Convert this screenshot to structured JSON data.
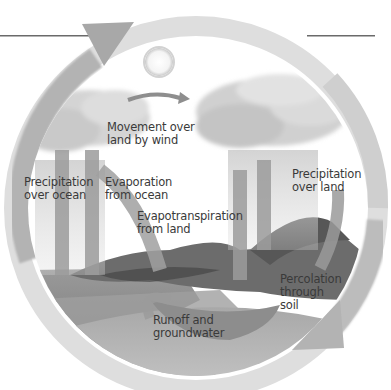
{
  "diagram": {
    "title": "",
    "theme": "water-cycle",
    "colors": {
      "outer_ring": "#c9c9c9",
      "outer_arrow": "#a9a9a9",
      "inner_arrow": "#9b9b9b",
      "cloud": "#d8d8d8",
      "ocean": "#8c8c8c",
      "land": "#6e6e6e",
      "ground": "#b5b5b5",
      "text": "#3a3a3a"
    },
    "labels": [
      {
        "id": "movement-over-land-by-wind",
        "lines": [
          "Movement over",
          "land by wind"
        ]
      },
      {
        "id": "precipitation-over-ocean",
        "lines": [
          "Precipitation",
          "over ocean"
        ]
      },
      {
        "id": "evaporation-from-ocean",
        "lines": [
          "Evaporation",
          "from ocean"
        ]
      },
      {
        "id": "evapotranspiration-from-land",
        "lines": [
          "Evapotranspiration",
          "from land"
        ]
      },
      {
        "id": "precipitation-over-land",
        "lines": [
          "Precipitation",
          "over land"
        ]
      },
      {
        "id": "percolation-through-soil",
        "lines": [
          "Percolation",
          "through",
          "soil"
        ]
      },
      {
        "id": "runoff-and-groundwater",
        "lines": [
          "Runoff and",
          "groundwater"
        ]
      }
    ]
  }
}
